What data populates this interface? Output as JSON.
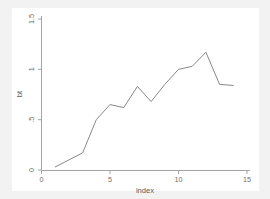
{
  "chart_data": {
    "type": "line",
    "title": "",
    "xlabel": "index",
    "ylabel": "bt",
    "xlim": [
      0,
      15.3
    ],
    "ylim": [
      0,
      1.55
    ],
    "xticks": [
      0,
      5,
      10,
      15
    ],
    "xticklabels": [
      "0",
      "5",
      "10",
      "15"
    ],
    "yticks": [
      0,
      0.5,
      1,
      1.5
    ],
    "yticklabels": [
      "0",
      ".5",
      "1",
      "1.5"
    ],
    "grid": false,
    "legend": null,
    "series": [
      {
        "name": "bt",
        "color": "#7a7a7a",
        "x": [
          1,
          2,
          3,
          4,
          5,
          6,
          7,
          8,
          9,
          10,
          11,
          12,
          13,
          14
        ],
        "values": [
          0.03,
          0.1,
          0.17,
          0.5,
          0.65,
          0.62,
          0.83,
          0.68,
          0.85,
          1.0,
          1.03,
          1.17,
          0.85,
          0.84
        ]
      }
    ]
  },
  "figure": {
    "background_color": "#f2f2f2",
    "panel_color": "#ffffff",
    "axis_color": "#9a9a9a",
    "text_color": "#6e6e6e"
  }
}
